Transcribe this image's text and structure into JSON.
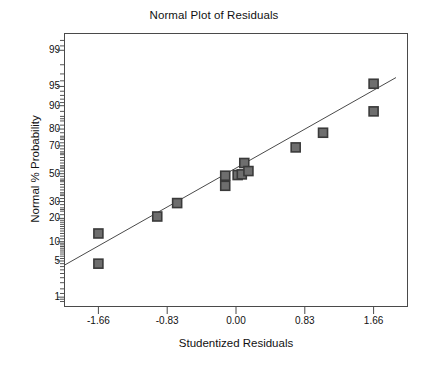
{
  "chart_data": {
    "type": "scatter",
    "title": "Normal Plot of Residuals",
    "xlabel": "Studentized Residuals",
    "ylabel": "Normal % Probability",
    "grid": false,
    "legend": null,
    "xlim": [
      -2.075,
      2.075
    ],
    "ylim_percent": [
      0.6,
      99.6
    ],
    "xticks": [
      "-1.66",
      "-0.83",
      "0.00",
      "0.83",
      "1.66"
    ],
    "xtick_values": [
      -1.66,
      -0.83,
      0.0,
      0.83,
      1.66
    ],
    "yticks": [
      "99",
      "95",
      "90",
      "80",
      "70",
      "50",
      "30",
      "20",
      "10",
      "5",
      "1"
    ],
    "ytick_values": [
      99,
      95,
      90,
      80,
      70,
      50,
      30,
      20,
      10,
      5,
      1
    ],
    "marker": "filled-square",
    "marker_color": "#6e6e6e",
    "marker_edge_color": "#3a3a3a",
    "line_color": "#4a4a4a",
    "points": [
      {
        "x": -1.66,
        "y": 4.5
      },
      {
        "x": -1.66,
        "y": 13.0
      },
      {
        "x": -0.95,
        "y": 21.0
      },
      {
        "x": -0.71,
        "y": 29.0
      },
      {
        "x": -0.13,
        "y": 41.0
      },
      {
        "x": -0.13,
        "y": 48.5
      },
      {
        "x": 0.02,
        "y": 49.0
      },
      {
        "x": 0.07,
        "y": 49.5
      },
      {
        "x": 0.1,
        "y": 58.0
      },
      {
        "x": 0.15,
        "y": 52.0
      },
      {
        "x": 0.72,
        "y": 69.0
      },
      {
        "x": 1.05,
        "y": 78.0
      },
      {
        "x": 1.66,
        "y": 88.0
      },
      {
        "x": 1.66,
        "y": 95.5
      }
    ],
    "reference_line": {
      "description": "normal probability reference line",
      "x_start": -2.075,
      "y_start_percent": 4.2,
      "x_end": 1.93,
      "y_end_percent": 96.5
    }
  }
}
